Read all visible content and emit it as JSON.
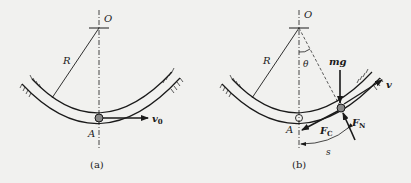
{
  "figure_a": {
    "caption": "(a)",
    "labels": {
      "center": "O",
      "radius": "R",
      "point": "A",
      "velocity": "v",
      "velocity_sub": "0"
    }
  },
  "figure_b": {
    "caption": "(b)",
    "labels": {
      "center": "O",
      "radius": "R",
      "angle": "θ",
      "point": "A",
      "gravity": "mg",
      "velocity": "v",
      "friction": "F",
      "friction_sub": "C",
      "normal": "F",
      "normal_sub": "N",
      "arc_length": "s"
    }
  },
  "colors": {
    "background": "#f1f1ef",
    "ink": "#1a1a1a",
    "bead": "#888888"
  }
}
